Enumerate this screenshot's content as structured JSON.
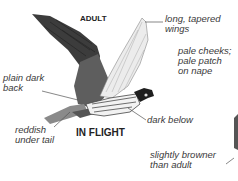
{
  "headings": {
    "adult": "ADULT",
    "in_flight": "IN FLIGHT"
  },
  "annotations": {
    "wings": "long, tapered\nwings",
    "cheeks": "pale cheeks;\npale patch\non nape",
    "back": "plain dark\nback",
    "below": "dark below",
    "tail": "reddish\nunder tail",
    "juvenile": "slightly browner\nthan adult"
  },
  "colors": {
    "dark_wing": "#3c3c3c",
    "back": "#5e5e5e",
    "tail": "#8a8a8a",
    "pale_wing": "#e8e8e8",
    "line": "#555555"
  }
}
